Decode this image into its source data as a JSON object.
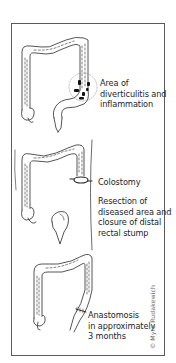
{
  "figure": {
    "panels": [
      {
        "id": "diverticulitis",
        "caption": "Area of\ndiverticulitis and\ninflammation"
      },
      {
        "id": "colostomy",
        "caption_stoma": "Colostomy",
        "caption_resection": "Resection of\ndiseased area and\nclosure of distal\nrectal stump"
      },
      {
        "id": "anastomosis",
        "caption": "Anastomosis\nin approximately\n3 months"
      }
    ],
    "credit": "© Myra Rudakewich"
  },
  "colors": {
    "line": "#2a2a2a",
    "frame": "#5a5a5a",
    "lesion": "#111111",
    "credit": "#6a6a6a"
  }
}
